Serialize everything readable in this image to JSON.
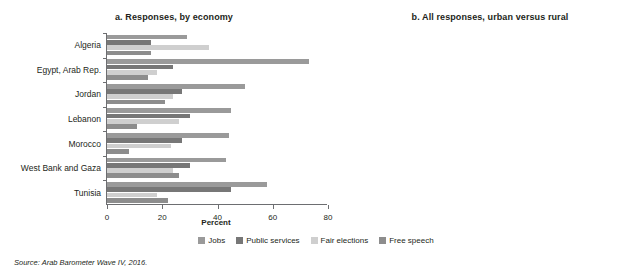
{
  "source_note": "Source: Arab Barometer Wave IV, 2016.",
  "legend": {
    "position": "bottom-center",
    "items": [
      {
        "label": "Jobs",
        "color": "#9a9a9a"
      },
      {
        "label": "Public services",
        "color": "#777777"
      },
      {
        "label": "Fair elections",
        "color": "#cfcfcf"
      },
      {
        "label": "Free speech",
        "color": "#8d8d8d"
      }
    ]
  },
  "chart_data": [
    {
      "id": "panel-a",
      "type": "bar",
      "orientation": "horizontal",
      "title": "a. Responses, by economy",
      "xlabel": "Percent",
      "ylabel": "",
      "xlim": [
        0,
        80
      ],
      "xticks": [
        0,
        20,
        40,
        60,
        80
      ],
      "grid": false,
      "categories": [
        "Algeria",
        "Egypt, Arab Rep.",
        "Jordan",
        "Lebanon",
        "Morocco",
        "West Bank and Gaza",
        "Tunisia"
      ],
      "series": [
        {
          "name": "Jobs",
          "color": "#9a9a9a",
          "values": [
            29,
            73,
            50,
            45,
            44,
            43,
            58
          ]
        },
        {
          "name": "Public services",
          "color": "#777777",
          "values": [
            16,
            24,
            27,
            30,
            27,
            30,
            45
          ]
        },
        {
          "name": "Fair elections",
          "color": "#cfcfcf",
          "values": [
            37,
            18,
            24,
            26,
            23,
            24,
            18
          ]
        },
        {
          "name": "Free speech",
          "color": "#8d8d8d",
          "values": [
            16,
            15,
            21,
            11,
            8,
            26,
            22
          ]
        }
      ]
    },
    {
      "id": "panel-b",
      "type": "bar",
      "orientation": "horizontal",
      "title": "b. All responses, urban versus rural",
      "xlabel": "Percent",
      "ylabel": "",
      "xlim": [
        0,
        52
      ],
      "xticks": [
        0,
        10,
        20,
        30,
        40,
        50
      ],
      "grid": false,
      "categories": [
        "Urban",
        "Rural"
      ],
      "series": [
        {
          "name": "Jobs",
          "color": "#9a9a9a",
          "values": [
            45,
            51.5
          ]
        },
        {
          "name": "Public services",
          "color": "#777777",
          "values": [
            26,
            30
          ]
        },
        {
          "name": "Fair elections",
          "color": "#cfcfcf",
          "values": [
            25,
            24
          ]
        },
        {
          "name": "Free speech",
          "color": "#8d8d8d",
          "values": [
            15.5,
            14.5
          ]
        }
      ]
    }
  ]
}
